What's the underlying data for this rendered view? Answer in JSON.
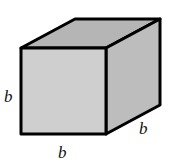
{
  "figure": {
    "type": "cube",
    "edge_labels": {
      "height": "b",
      "width": "b",
      "depth": "b"
    },
    "colors": {
      "front_face": "#cfcfcf",
      "top_face": "#b5b5b5",
      "side_face": "#bdbdbd",
      "edge": "#000000"
    }
  }
}
